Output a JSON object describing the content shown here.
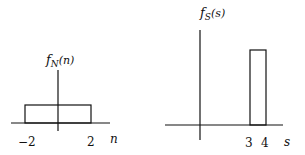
{
  "left_plot": {
    "title_main": "f",
    "title_sub": "N",
    "title_arg": "(n)",
    "axis_label": "n",
    "tick_left": "−2",
    "tick_right": "2",
    "rect": {
      "from": -2,
      "to": 2
    }
  },
  "right_plot": {
    "title_main": "f",
    "title_sub": "S",
    "title_arg": "(s)",
    "axis_label": "s",
    "tick_left": "3",
    "tick_right": "4",
    "rect": {
      "from": 3,
      "to": 4
    }
  },
  "colors": {
    "stroke": "#111111",
    "background": "#ffffff"
  }
}
